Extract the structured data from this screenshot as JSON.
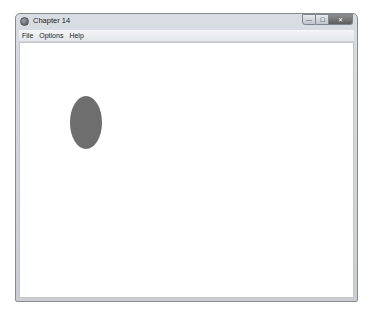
{
  "window": {
    "title": "Chapter 14",
    "controls": {
      "minimize": "—",
      "maximize": "☐",
      "close": "✕"
    }
  },
  "menubar": {
    "items": [
      {
        "label": "File"
      },
      {
        "label": "Options"
      },
      {
        "label": "Help"
      }
    ]
  },
  "canvas": {
    "shapes": [
      {
        "type": "ellipse",
        "fill": "#6e6e6e",
        "left": 50,
        "top": 53,
        "width": 32,
        "height": 53
      }
    ]
  },
  "caption": {
    "text": ""
  }
}
